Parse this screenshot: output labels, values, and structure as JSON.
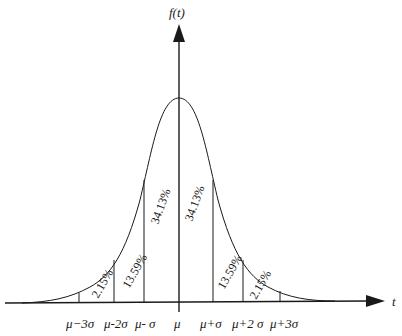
{
  "diagram": {
    "y_axis_label": "f(t)",
    "x_axis_label": "t",
    "ticks": [
      "μ−3σ",
      "μ-2σ",
      "μ- σ",
      "μ",
      "μ+σ",
      "μ+2 σ",
      "μ+3σ"
    ],
    "regions": {
      "left_outer": "2.15%",
      "left_middle": "13.59%",
      "left_inner": "34.13%",
      "right_inner": "34.13%",
      "right_middle": "13.59%",
      "right_outer": "2.15%"
    },
    "colors": {
      "line": "#1a1a1a",
      "background": "#ffffff"
    }
  }
}
